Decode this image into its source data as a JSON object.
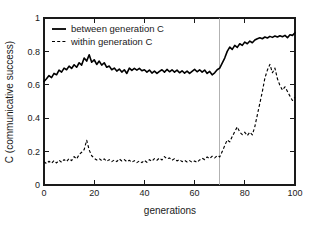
{
  "chart_data": {
    "type": "line",
    "title": "",
    "xlabel": "generations",
    "ylabel": "C (communicative success)",
    "xlim": [
      0,
      100
    ],
    "ylim": [
      0,
      1
    ],
    "xticks": [
      0,
      20,
      40,
      60,
      80,
      100
    ],
    "yticks": [
      0,
      0.2,
      0.4,
      0.6,
      0.8,
      1
    ],
    "xtick_labels": [
      "0",
      "20",
      "40",
      "60",
      "80",
      "100"
    ],
    "ytick_labels": [
      "0",
      "0.2",
      "0.4",
      "0.6",
      "0.8",
      "1"
    ],
    "grid": false,
    "legend_position": "top-left",
    "annotations": [
      {
        "name": "vertical-marker",
        "type": "vline",
        "x": 70,
        "color": "#aaaaaa"
      }
    ],
    "x": [
      0,
      1,
      2,
      3,
      4,
      5,
      6,
      7,
      8,
      9,
      10,
      11,
      12,
      13,
      14,
      15,
      16,
      17,
      18,
      19,
      20,
      21,
      22,
      23,
      24,
      25,
      26,
      27,
      28,
      29,
      30,
      31,
      32,
      33,
      34,
      35,
      36,
      37,
      38,
      39,
      40,
      41,
      42,
      43,
      44,
      45,
      46,
      47,
      48,
      49,
      50,
      51,
      52,
      53,
      54,
      55,
      56,
      57,
      58,
      59,
      60,
      61,
      62,
      63,
      64,
      65,
      66,
      67,
      68,
      69,
      70,
      71,
      72,
      73,
      74,
      75,
      76,
      77,
      78,
      79,
      80,
      81,
      82,
      83,
      84,
      85,
      86,
      87,
      88,
      89,
      90,
      91,
      92,
      93,
      94,
      95,
      96,
      97,
      98,
      99,
      100
    ],
    "series": [
      {
        "name": "between generation C",
        "style": "solid",
        "color": "#000000",
        "values": [
          0.62,
          0.636,
          0.655,
          0.643,
          0.668,
          0.66,
          0.688,
          0.676,
          0.7,
          0.69,
          0.712,
          0.698,
          0.72,
          0.705,
          0.732,
          0.718,
          0.76,
          0.742,
          0.78,
          0.735,
          0.75,
          0.722,
          0.742,
          0.718,
          0.732,
          0.705,
          0.712,
          0.69,
          0.7,
          0.682,
          0.694,
          0.676,
          0.69,
          0.668,
          0.7,
          0.686,
          0.698,
          0.688,
          0.698,
          0.684,
          0.69,
          0.676,
          0.688,
          0.67,
          0.682,
          0.668,
          0.68,
          0.69,
          0.676,
          0.692,
          0.678,
          0.69,
          0.676,
          0.688,
          0.672,
          0.684,
          0.67,
          0.682,
          0.668,
          0.68,
          0.692,
          0.678,
          0.69,
          0.676,
          0.688,
          0.668,
          0.68,
          0.66,
          0.672,
          0.69,
          0.7,
          0.73,
          0.76,
          0.8,
          0.826,
          0.812,
          0.836,
          0.824,
          0.846,
          0.836,
          0.856,
          0.846,
          0.862,
          0.852,
          0.868,
          0.876,
          0.882,
          0.876,
          0.886,
          0.88,
          0.89,
          0.884,
          0.892,
          0.886,
          0.894,
          0.888,
          0.896,
          0.882,
          0.9,
          0.896,
          0.912
        ]
      },
      {
        "name": "within generation C",
        "style": "dashed",
        "color": "#000000",
        "values": [
          0.14,
          0.128,
          0.142,
          0.13,
          0.146,
          0.132,
          0.148,
          0.136,
          0.152,
          0.14,
          0.158,
          0.146,
          0.17,
          0.156,
          0.182,
          0.196,
          0.212,
          0.268,
          0.21,
          0.175,
          0.16,
          0.15,
          0.158,
          0.146,
          0.156,
          0.142,
          0.152,
          0.14,
          0.15,
          0.14,
          0.156,
          0.144,
          0.152,
          0.14,
          0.148,
          0.136,
          0.146,
          0.134,
          0.144,
          0.134,
          0.148,
          0.136,
          0.152,
          0.142,
          0.158,
          0.148,
          0.162,
          0.15,
          0.17,
          0.156,
          0.162,
          0.148,
          0.158,
          0.144,
          0.152,
          0.14,
          0.148,
          0.138,
          0.146,
          0.136,
          0.144,
          0.136,
          0.15,
          0.16,
          0.152,
          0.168,
          0.158,
          0.172,
          0.162,
          0.176,
          0.168,
          0.2,
          0.236,
          0.27,
          0.258,
          0.29,
          0.32,
          0.348,
          0.316,
          0.302,
          0.316,
          0.296,
          0.316,
          0.3,
          0.35,
          0.42,
          0.49,
          0.56,
          0.64,
          0.688,
          0.722,
          0.672,
          0.7,
          0.636,
          0.596,
          0.568,
          0.588,
          0.56,
          0.532,
          0.506,
          0.526
        ]
      }
    ]
  },
  "legend": {
    "items": [
      {
        "label": "between generation C",
        "style": "solid"
      },
      {
        "label": "within generation C",
        "style": "dashed"
      }
    ]
  },
  "axes": {
    "x_title": "generations",
    "y_title": "C (communicative success)"
  }
}
